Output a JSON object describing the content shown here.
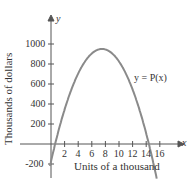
{
  "chart_data": {
    "type": "line",
    "title": "",
    "function_label": "y = P(x)",
    "xlabel": "Units of a thousand",
    "ylabel": "Thousands of dollars",
    "x_axis_symbol": "x",
    "y_axis_symbol": "y",
    "x_ticks": [
      "2",
      "4",
      "6",
      "8",
      "10",
      "12",
      "14",
      "16"
    ],
    "y_ticks": [
      "-200",
      "200",
      "400",
      "600",
      "800",
      "1000"
    ],
    "xlim": [
      0,
      16
    ],
    "ylim": [
      -250,
      1100
    ],
    "grid": false,
    "series": [
      {
        "name": "P(x)",
        "x": [
          0,
          1,
          2,
          3,
          4,
          5,
          6,
          7,
          7.5,
          8,
          9,
          10,
          11,
          12,
          13,
          14,
          15
        ],
        "values": [
          -175,
          105,
          345,
          545,
          705,
          825,
          905,
          945,
          950,
          945,
          905,
          825,
          705,
          545,
          345,
          105,
          -175
        ]
      }
    ],
    "color": "#8a8a8a"
  }
}
